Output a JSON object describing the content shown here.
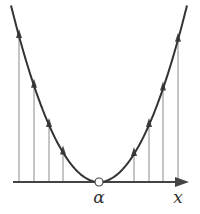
{
  "diagram": {
    "type": "function-plot-with-vertical-arrows",
    "axis": {
      "label": "x",
      "y_px": 182,
      "x_start_px": 13,
      "x_end_px": 189
    },
    "point": {
      "label": "α",
      "x_px": 99,
      "style": "open-circle"
    },
    "curve": {
      "shape": "parabola",
      "vertex_px": [
        99,
        182
      ],
      "coefficient": 0.0228,
      "x_range_px": [
        11,
        187
      ]
    },
    "arrows_x_px": [
      19,
      34,
      49,
      63,
      134,
      149,
      163,
      178
    ],
    "colors": {
      "curve": "#333333",
      "axis": "#444444",
      "arrow_lines": "#8a8a8a",
      "arrowheads": "#444444",
      "text": "#333333"
    }
  }
}
